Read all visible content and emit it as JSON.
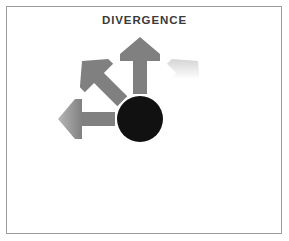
{
  "figure": {
    "title": "DIVERGENCE",
    "background_color": "#ffffff",
    "border_color": "#9a9a9a",
    "title_color": "#3a3a3a"
  },
  "diagram": {
    "name": "divergence-radial-arrows",
    "center": {
      "x": 140,
      "y": 119
    },
    "hub": {
      "label": "",
      "shape": "circle",
      "radius": 23,
      "color": "#111111"
    },
    "arrow_style": {
      "tip_color": "#808080",
      "base_color": "#ffffff",
      "inner_radius": 25,
      "outer_radius": 82,
      "shaft_half_width": 7,
      "head_half_width": 20,
      "head_length": 24,
      "notch_depth": 7
    },
    "arrows": [
      {
        "id": "arrow-n",
        "label": "",
        "direction": "north",
        "angle_deg": -90
      },
      {
        "id": "arrow-ne",
        "label": "",
        "direction": "northeast",
        "angle_deg": -45
      },
      {
        "id": "arrow-e",
        "label": "",
        "direction": "east",
        "angle_deg": 0
      },
      {
        "id": "arrow-se",
        "label": "",
        "direction": "southeast",
        "angle_deg": 45
      },
      {
        "id": "arrow-s",
        "label": "",
        "direction": "south",
        "angle_deg": 90
      },
      {
        "id": "arrow-sw",
        "label": "",
        "direction": "southwest",
        "angle_deg": 135
      },
      {
        "id": "arrow-w",
        "label": "",
        "direction": "west",
        "angle_deg": 180
      },
      {
        "id": "arrow-nw",
        "label": "",
        "direction": "northwest",
        "angle_deg": 225
      }
    ]
  },
  "chart_data": {
    "type": "diagram",
    "title": "DIVERGENCE",
    "subtitle": "",
    "xlabel": "",
    "ylabel": "",
    "categories": [
      "north",
      "northeast",
      "east",
      "southeast",
      "south",
      "southwest",
      "west",
      "northwest"
    ],
    "values": [
      1,
      1,
      1,
      1,
      1,
      1,
      1,
      1
    ],
    "legend": [],
    "annotations": [
      "DIVERGENCE"
    ],
    "grid": false
  }
}
